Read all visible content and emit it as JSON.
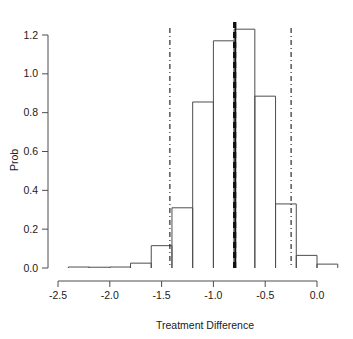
{
  "chart_data": {
    "type": "bar",
    "subtype": "histogram",
    "title": "",
    "xlabel": "Treatment Difference",
    "ylabel": "Prob",
    "xlim": [
      -2.45,
      0.2
    ],
    "ylim": [
      0.0,
      1.26
    ],
    "grid": false,
    "legend": "none",
    "xticks": [
      -2.5,
      -2.0,
      -1.5,
      -1.0,
      -0.5,
      0.0
    ],
    "xtick_labels": [
      "-2.5",
      "-2.0",
      "-1.5",
      "-1.0",
      "-0.5",
      "0.0"
    ],
    "yticks": [
      0.0,
      0.2,
      0.4,
      0.6,
      0.8,
      1.0,
      1.2
    ],
    "ytick_labels": [
      "0.0",
      "0.2",
      "0.4",
      "0.6",
      "0.8",
      "1.0",
      "1.2"
    ],
    "bin_width": 0.2,
    "bin_edges": [
      -2.4,
      -2.2,
      -2.0,
      -1.8,
      -1.6,
      -1.4,
      -1.2,
      -1.0,
      -0.8,
      -0.6,
      -0.4,
      -0.2,
      0.0,
      0.2
    ],
    "bin_centers": [
      -2.3,
      -2.1,
      -1.9,
      -1.7,
      -1.5,
      -1.3,
      -1.1,
      -0.9,
      -0.7,
      -0.5,
      -0.3,
      -0.1,
      0.1
    ],
    "values": [
      0.005,
      0.004,
      0.005,
      0.025,
      0.115,
      0.31,
      0.855,
      1.17,
      1.23,
      0.885,
      0.33,
      0.065,
      0.02
    ],
    "annotations": [
      {
        "name": "lower-credible-limit",
        "type": "vline",
        "x": -1.42,
        "style": "dash-dot"
      },
      {
        "name": "upper-credible-limit",
        "type": "vline",
        "x": -0.25,
        "style": "dash-dot"
      },
      {
        "name": "posterior-mean-dashed",
        "type": "vline",
        "x": -0.795,
        "style": "thick-dashed"
      },
      {
        "name": "posterior-median-solid",
        "type": "vline",
        "x": -0.787,
        "style": "solid"
      }
    ],
    "colors": {
      "axis": "#4d4d4d",
      "bar_outline": "#4d4d4d",
      "bar_fill": "none",
      "reference_line": "#111111",
      "text": "#1a1a1a",
      "background": "#ffffff"
    }
  }
}
